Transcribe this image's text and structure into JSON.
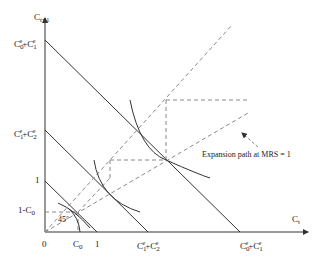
{
  "diagram": {
    "axes": {
      "y_label": "C",
      "y_label_sub": "t+1",
      "x_label": "C",
      "x_label_sub": "t",
      "origin_label": "0"
    },
    "y_ticks": [
      {
        "id": "c0e_c1e",
        "base": "C",
        "sub1": "0",
        "sup1": "e",
        "plus": "+C",
        "sub2": "1",
        "sup2": "e"
      },
      {
        "id": "c1e_c2e",
        "base": "C",
        "sub1": "1",
        "sup1": "e",
        "plus": "+C",
        "sub2": "2",
        "sup2": "e"
      },
      {
        "id": "one",
        "text": "1"
      },
      {
        "id": "one_minus_c0",
        "text": "1-C",
        "sub": "0"
      }
    ],
    "x_ticks": [
      {
        "id": "c0",
        "base": "C",
        "sub": "0"
      },
      {
        "id": "one",
        "text": "1"
      },
      {
        "id": "c1e_c2e",
        "base": "C",
        "sub1": "1",
        "sup1": "e",
        "plus": "+C",
        "sub2": "2",
        "sup2": "e"
      },
      {
        "id": "c0e_c1e",
        "base": "C",
        "sub1": "0",
        "sup1": "e",
        "plus": "+C",
        "sub2": "1",
        "sup2": "e"
      }
    ],
    "angle_label": "45°",
    "annotation": "Expansion path at MRS = 1",
    "colors": {
      "solid": "#333333",
      "dashed": "#888888",
      "text": "#222222"
    }
  }
}
